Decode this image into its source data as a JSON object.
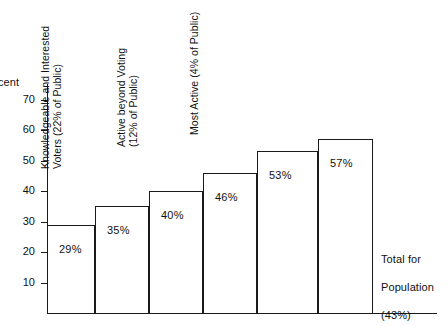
{
  "chart_data": {
    "type": "bar",
    "title": "",
    "xlabel": "",
    "ylabel": "Percent",
    "ylim": [
      0,
      75
    ],
    "grid": false,
    "legend": "none",
    "categories": [
      "Inactives",
      "Irregular Voters",
      "Regular Voters (Not Active beyond Voting)",
      "Knowledgeable and Interested Voters (22% of Public)",
      "Active beyond Voting (12% of Public)",
      "Most Active (4% of Public)"
    ],
    "values": [
      29,
      35,
      40,
      46,
      53,
      57
    ],
    "value_labels": [
      "29%",
      "35%",
      "40%",
      "46%",
      "53%",
      "57%"
    ],
    "tick_labels": [
      "70",
      "60",
      "50",
      "40",
      "30",
      "20",
      "10"
    ],
    "tick_values": [
      70,
      60,
      50,
      40,
      30,
      20,
      10
    ],
    "annotation": "Total for\nPopulation\n(43%)"
  },
  "axis": {
    "y_title": "cent",
    "ticks": [
      {
        "label": "70",
        "value": 70
      },
      {
        "label": "60",
        "value": 60
      },
      {
        "label": "50",
        "value": 50
      },
      {
        "label": "40",
        "value": 40
      },
      {
        "label": "30",
        "value": 30
      },
      {
        "label": "20",
        "value": 20
      },
      {
        "label": "10",
        "value": 10
      }
    ]
  },
  "bars": [
    {
      "label_line1": "Inactives",
      "label_line2": "",
      "value_label": "29%"
    },
    {
      "label_line1": "Irregular Voters",
      "label_line2": "",
      "value_label": "35%"
    },
    {
      "label_line1": "Regular Voters (Not Active",
      "label_line2": "beyond Voting)",
      "value_label": "40%"
    },
    {
      "label_line1": "Knowledgeable and Interested",
      "label_line2": "Voters (22% of Public)",
      "value_label": "46%"
    },
    {
      "label_line1": "Active beyond Voting",
      "label_line2": "(12% of Public)",
      "value_label": "53%"
    },
    {
      "label_line1": "Most Active (4% of Public)",
      "label_line2": "",
      "value_label": "57%"
    }
  ],
  "annotation": {
    "line1": "Total  for",
    "line2": "Population",
    "line3": "(43%)"
  },
  "colors": {
    "ink": "#1a1a1a",
    "background": "#ffffff"
  }
}
